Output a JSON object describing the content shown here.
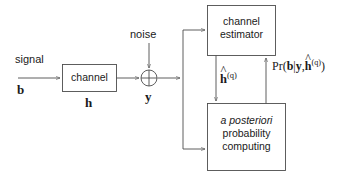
{
  "diagram": {
    "background_color": "#ffffff",
    "line_color": "#4d4d4d",
    "text_color": "#1a1a1a"
  },
  "labels": {
    "signal": "signal",
    "signal_symbol": "b",
    "channel_symbol": "h",
    "noise": "noise",
    "received_symbol": "y",
    "channel_estimate_base": "h",
    "channel_estimate_sup": "(q)",
    "posterior_prefix": "Pr(",
    "posterior_b": "b",
    "posterior_bar": "|",
    "posterior_y": "y",
    "posterior_comma": ",",
    "posterior_h": "h",
    "posterior_sup": "(q)",
    "posterior_suffix": ")",
    "hat_glyph": "^"
  },
  "blocks": {
    "channel": {
      "name": "channel",
      "line1": "channel"
    },
    "channel_estimator": {
      "name": "channel-estimator",
      "line1": "channel",
      "line2": "estimator"
    },
    "app_computing": {
      "name": "a-posteriori-probability-computing",
      "line1": "a posteriori",
      "line2": "probability",
      "line3": "computing"
    }
  },
  "nodes": {
    "adder": {
      "name": "summation-node",
      "kind": "circle-plus"
    }
  },
  "connections": [
    {
      "from": "signal-b",
      "to": "channel",
      "name": "signal-to-channel"
    },
    {
      "from": "channel",
      "to": "adder",
      "name": "channel-to-adder"
    },
    {
      "from": "noise",
      "to": "adder",
      "name": "noise-to-adder"
    },
    {
      "from": "adder",
      "to": "branch",
      "name": "adder-to-branch"
    },
    {
      "from": "branch",
      "to": "channel-estimator",
      "name": "y-to-channel-estimator"
    },
    {
      "from": "branch",
      "to": "app-computing",
      "name": "y-to-app-computing"
    },
    {
      "from": "channel-estimator",
      "to": "app-computing",
      "name": "h-estimate-feed-forward"
    },
    {
      "from": "app-computing",
      "to": "channel-estimator",
      "name": "posterior-feedback"
    }
  ]
}
